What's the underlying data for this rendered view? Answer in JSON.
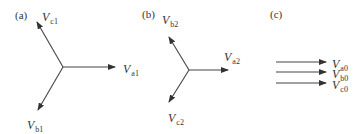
{
  "colors": {
    "line": "#444444",
    "text": "#333333",
    "background": "#ffffff"
  },
  "panels": [
    {
      "id": "a",
      "label": "(a)",
      "label_pos": [
        15,
        10
      ],
      "title": "Positive sequence",
      "origin": [
        63,
        67
      ],
      "phasors": [
        {
          "name": "V",
          "sub": "a1",
          "end": [
            115,
            67
          ],
          "label_pos": [
            123,
            60
          ]
        },
        {
          "name": "V",
          "sub": "b1",
          "end": [
            38,
            110
          ],
          "label_pos": [
            27,
            116
          ]
        },
        {
          "name": "V",
          "sub": "c1",
          "end": [
            37,
            22
          ],
          "label_pos": [
            42,
            8
          ]
        }
      ]
    },
    {
      "id": "b",
      "label": "(b)",
      "label_pos": [
        142,
        9
      ],
      "title": "Negative sequence",
      "origin": [
        189,
        70
      ],
      "phasors": [
        {
          "name": "V",
          "sub": "a2",
          "end": [
            228,
            70
          ],
          "label_pos": [
            224,
            48
          ]
        },
        {
          "name": "V",
          "sub": "b2",
          "end": [
            169,
            37
          ],
          "label_pos": [
            162,
            11
          ]
        },
        {
          "name": "V",
          "sub": "c2",
          "end": [
            169,
            102
          ],
          "label_pos": [
            168,
            109
          ]
        }
      ]
    },
    {
      "id": "c",
      "label": "(c)",
      "label_pos": [
        270,
        9
      ],
      "title": "Zero sequence",
      "phasors": [
        {
          "name": "V",
          "sub": "a0",
          "start": [
            276,
            62
          ],
          "end": [
            326,
            62
          ],
          "label_pos": [
            332,
            55
          ]
        },
        {
          "name": "V",
          "sub": "b0",
          "start": [
            276,
            72
          ],
          "end": [
            326,
            72
          ],
          "label_pos": [
            332,
            65
          ]
        },
        {
          "name": "V",
          "sub": "c0",
          "start": [
            276,
            83
          ],
          "end": [
            326,
            83
          ],
          "label_pos": [
            332,
            76
          ]
        }
      ]
    }
  ]
}
